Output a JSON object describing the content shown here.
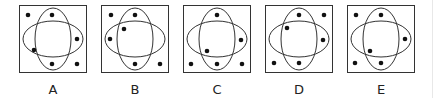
{
  "puzzle": {
    "box_size": 68,
    "stroke_color": "#333333",
    "dot_color": "#111111",
    "ellipses": {
      "vertical": {
        "cx": 34,
        "cy": 34,
        "rx": 18,
        "ry": 31
      },
      "horizontal": {
        "cx": 34,
        "cy": 34,
        "rx": 30,
        "ry": 18
      }
    },
    "options": [
      {
        "label": "A",
        "left": 19,
        "dots": [
          [
            9,
            10
          ],
          [
            33,
            10
          ],
          [
            58,
            34
          ],
          [
            15,
            45
          ],
          [
            33,
            59
          ],
          [
            58,
            59
          ]
        ]
      },
      {
        "label": "B",
        "left": 101,
        "dots": [
          [
            10,
            10
          ],
          [
            34,
            10
          ],
          [
            23,
            24
          ],
          [
            9,
            34
          ],
          [
            34,
            59
          ],
          [
            59,
            59
          ]
        ]
      },
      {
        "label": "C",
        "left": 183,
        "dots": [
          [
            34,
            10
          ],
          [
            58,
            35
          ],
          [
            24,
            46
          ],
          [
            8,
            59
          ],
          [
            34,
            59
          ],
          [
            59,
            59
          ]
        ]
      },
      {
        "label": "D",
        "left": 265,
        "dots": [
          [
            34,
            10
          ],
          [
            59,
            10
          ],
          [
            22,
            23
          ],
          [
            58,
            35
          ],
          [
            9,
            58
          ],
          [
            34,
            58
          ]
        ]
      },
      {
        "label": "E",
        "left": 347,
        "dots": [
          [
            9,
            10
          ],
          [
            34,
            10
          ],
          [
            58,
            34
          ],
          [
            23,
            46
          ],
          [
            8,
            58
          ],
          [
            34,
            58
          ]
        ]
      }
    ]
  }
}
